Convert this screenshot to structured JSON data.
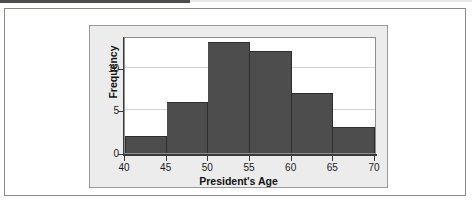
{
  "figure": {
    "background_color": "#ffffff",
    "panel_color": "#ececec",
    "plot_background_color": "#ffffff",
    "border_color": "#8a8a8e"
  },
  "chart_data": {
    "type": "bar",
    "title": "",
    "xlabel": "President's Age",
    "ylabel": "Frequency",
    "categories": [
      "40-45",
      "45-50",
      "50-55",
      "55-60",
      "60-65",
      "65-70"
    ],
    "bin_edges": [
      40,
      45,
      50,
      55,
      60,
      65,
      70
    ],
    "values": [
      2,
      6,
      13,
      12,
      7,
      3
    ],
    "xlim": [
      40,
      70
    ],
    "ylim": [
      0,
      13.5
    ],
    "xticks": [
      40,
      45,
      50,
      55,
      60,
      65,
      70
    ],
    "xtick_labels": [
      "40",
      "45",
      "50",
      "55",
      "60",
      "65",
      "70"
    ],
    "yticks": [
      0,
      5,
      10
    ],
    "ytick_labels": [
      "0",
      "5",
      "10"
    ],
    "gridlines": [
      5,
      10
    ],
    "grid": true,
    "legend": "none",
    "bar_color": "#4d4d4d",
    "bar_edge_color": "#2e2e2e",
    "gridline_color": "#d2d2d2"
  }
}
